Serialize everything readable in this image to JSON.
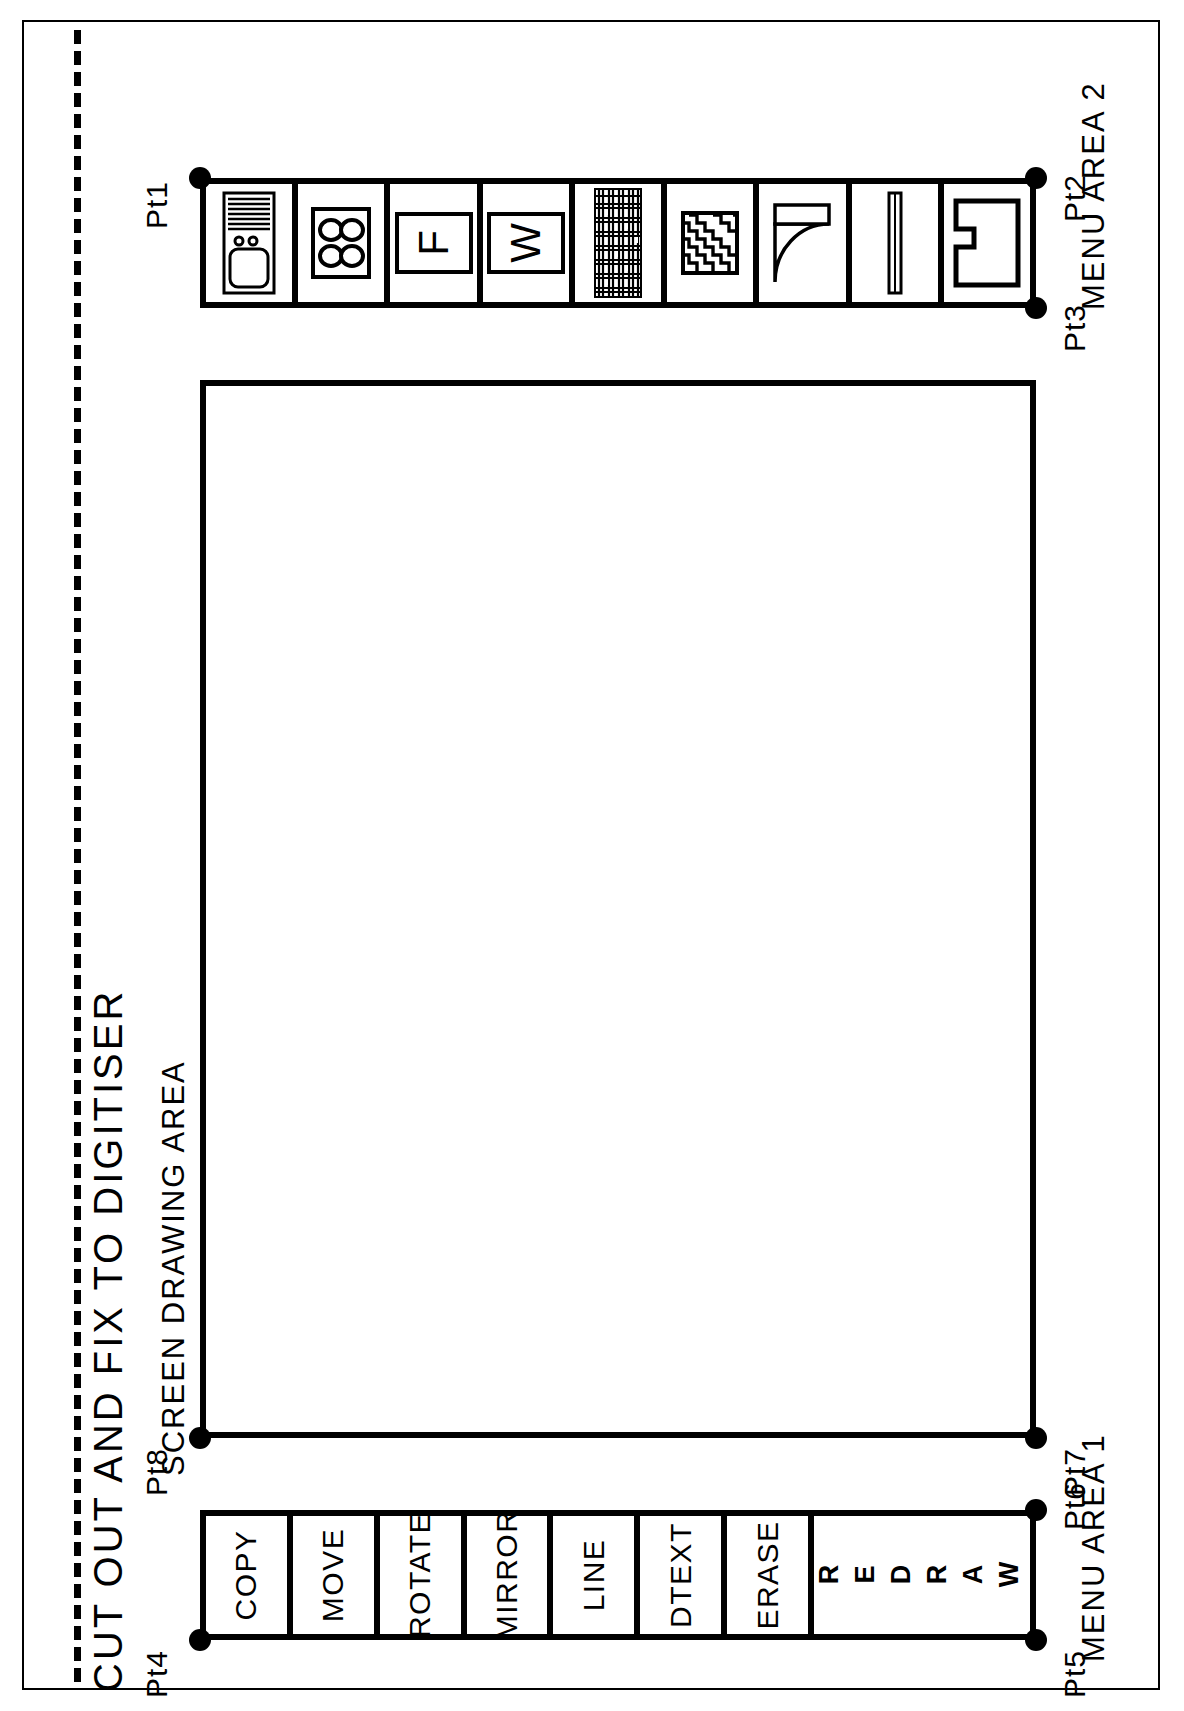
{
  "sheet": {
    "title": "CUT OUT AND FIX TO DIGITISER",
    "cut_line": "dashed-cut-line"
  },
  "captions": {
    "screen_drawing_area": "SCREEN DRAWING AREA",
    "menu_area_1": "MENU AREA 1",
    "menu_area_2": "MENU AREA 2"
  },
  "calibration_points": {
    "pt1": "Pt1",
    "pt2": "Pt2",
    "pt3": "Pt3",
    "pt4": "Pt4",
    "pt5": "Pt5",
    "pt6": "Pt6",
    "pt7": "Pt7",
    "pt8": "Pt8"
  },
  "menu_area_2": {
    "label": "MENU AREA 2",
    "commands": [
      {
        "label": "COPY",
        "style": "plain"
      },
      {
        "label": "MOVE",
        "style": "plain"
      },
      {
        "label": "ROTATE",
        "style": "plain"
      },
      {
        "label": "MIRROR",
        "style": "plain"
      },
      {
        "label": "LINE",
        "style": "plain"
      },
      {
        "label": "DTEXT",
        "style": "plain"
      },
      {
        "label": "ERASE",
        "style": "plain"
      },
      {
        "label": "REDRAW",
        "style": "stacked"
      }
    ]
  },
  "menu_area_1": {
    "label": "MENU AREA 1",
    "symbols": [
      {
        "icon": "cooker-oven-icon",
        "name": "cooker / oven elevation"
      },
      {
        "icon": "hob-four-ring-icon",
        "name": "four ring hob"
      },
      {
        "icon": "fridge-f-icon",
        "name": "F",
        "letter": "F"
      },
      {
        "icon": "washer-w-icon",
        "name": "W",
        "letter": "W"
      },
      {
        "icon": "brickwork-hatch-icon",
        "name": "brickwork hatch"
      },
      {
        "icon": "insulation-hatch-icon",
        "name": "insulation zigzag hatch"
      },
      {
        "icon": "door-swing-icon",
        "name": "door swing"
      },
      {
        "icon": "window-bar-icon",
        "name": "window / thin bar"
      },
      {
        "icon": "sink-polygon-icon",
        "name": "notched L polygon"
      }
    ]
  },
  "colors": {
    "ink": "#000000",
    "paper": "#ffffff"
  }
}
